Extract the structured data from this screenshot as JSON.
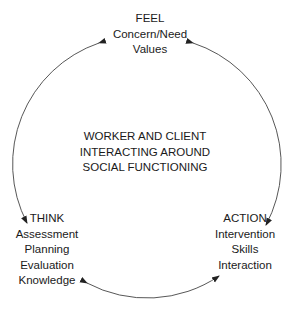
{
  "center": {
    "lines": [
      "WORKER AND CLIENT",
      "INTERACTING AROUND",
      "SOCIAL FUNCTIONING"
    ]
  },
  "nodes": {
    "feel": {
      "title": "FEEL",
      "items": [
        "Concern/Need",
        "Values"
      ]
    },
    "think": {
      "title": "THINK",
      "items": [
        "Assessment",
        "Planning",
        "Evaluation",
        "Knowledge"
      ]
    },
    "action": {
      "title": "ACTION",
      "items": [
        "Intervention",
        "Skills",
        "Interaction"
      ]
    }
  },
  "arcs": [
    {
      "from": "feel",
      "to": "think",
      "direction": "bidirectional"
    },
    {
      "from": "feel",
      "to": "action",
      "direction": "bidirectional"
    },
    {
      "from": "think",
      "to": "action",
      "direction": "bidirectional"
    }
  ],
  "colors": {
    "line": "#333333",
    "text": "#1a1a1a",
    "background": "#ffffff"
  }
}
